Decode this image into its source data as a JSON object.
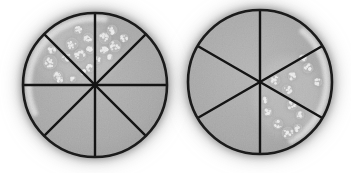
{
  "figure": {
    "alt": "Photograph of two round agar petri dishes divided into wedge-shaped sectors by black marker lines; speckled bacterial colonies grow in the upper-left sectors of the left dish and the right-hand sectors of the right dish",
    "geometry": {
      "cx": 80,
      "cy": 80,
      "r": 72
    },
    "colors": {
      "agar_center": "#b6b6b6",
      "agar_mid": "#a9a9a9",
      "agar_edge": "#9d9d9d",
      "outline": "#1b1b1b",
      "divider": "#141414",
      "rim_highlight": "#e2e2e2",
      "film": "#c6c6c6",
      "colony_body": "#bdbdbd",
      "colony_halo": "#8f8f8f",
      "colony_ring": "#d8d8d8",
      "colony_speck": "#efefef",
      "background": "#ffffff",
      "glow": "#787878"
    },
    "dishes": [
      {
        "name": "petri-dish-left",
        "sector_count": 8,
        "divider_angles_deg": [
          0,
          45,
          90,
          135
        ],
        "growth_location": "upper-left and top sectors",
        "rim_highlight_arc_deg": [
          82,
          205
        ],
        "film": [
          62,
          48,
          42,
          30
        ],
        "colonies": [
          [
            35,
            57,
            7
          ],
          [
            43,
            71,
            5
          ],
          [
            37,
            45,
            4
          ],
          [
            51,
            52,
            5
          ],
          [
            57,
            39,
            6
          ],
          [
            65,
            50,
            6
          ],
          [
            63,
            25,
            4
          ],
          [
            73,
            33,
            5
          ],
          [
            75,
            45,
            4
          ],
          [
            75,
            63,
            4
          ],
          [
            82,
            55,
            4
          ],
          [
            68,
            67,
            3
          ],
          [
            90,
            33,
            6
          ],
          [
            97,
            25,
            5
          ],
          [
            100,
            41,
            6
          ],
          [
            109,
            33,
            4
          ],
          [
            89,
            45,
            4
          ],
          [
            95,
            52,
            3
          ],
          [
            45,
            75,
            3
          ],
          [
            58,
            74,
            3
          ]
        ]
      },
      {
        "name": "petri-dish-right",
        "sector_count": 6,
        "divider_angles_deg": [
          90,
          30,
          150
        ],
        "growth_location": "right and lower-right sectors",
        "rim_highlight_arc_deg": [
          -62,
          50
        ],
        "film": [
          108,
          95,
          34,
          40
        ],
        "colonies": [
          [
            128,
            66,
            5
          ],
          [
            138,
            80,
            4
          ],
          [
            123,
            56,
            4
          ],
          [
            95,
            78,
            5
          ],
          [
            107,
            88,
            5
          ],
          [
            112,
            74,
            4
          ],
          [
            112,
            103,
            5
          ],
          [
            120,
            113,
            4
          ],
          [
            88,
            110,
            4
          ],
          [
            98,
            122,
            5
          ],
          [
            108,
            131,
            6
          ],
          [
            85,
            98,
            3
          ],
          [
            118,
            126,
            4
          ]
        ]
      }
    ]
  }
}
